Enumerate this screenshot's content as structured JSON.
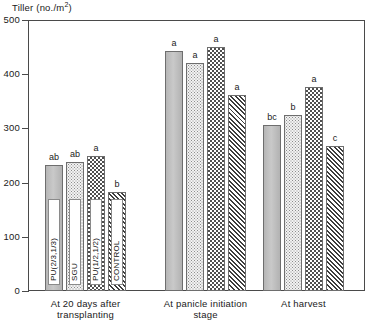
{
  "chart_data": {
    "type": "bar",
    "title": "",
    "ylabel": "Tiller (no./m²)",
    "xlabel": "",
    "ylim": [
      0,
      500
    ],
    "yticks": [
      0,
      100,
      200,
      300,
      400,
      500
    ],
    "ytick_labels": [
      "0",
      "100",
      "200",
      "300",
      "400",
      "500"
    ],
    "grid": false,
    "legend_position": "in-bar-vertical-labels",
    "categories": [
      "At 20 days after transplanting",
      "At panicle initiation stage",
      "At harvest"
    ],
    "series": [
      {
        "name": "PU(2/3,1/3)",
        "pattern": "solid-gray",
        "values": [
          232,
          443,
          307
        ],
        "letters": [
          "ab",
          "a",
          "bc"
        ]
      },
      {
        "name": "SGU",
        "pattern": "light-dots",
        "values": [
          238,
          421,
          325
        ],
        "letters": [
          "ab",
          "a",
          "b"
        ]
      },
      {
        "name": "PU(1/2,1/2)",
        "pattern": "checkerboard",
        "values": [
          249,
          450,
          376
        ],
        "letters": [
          "a",
          "a",
          "a"
        ]
      },
      {
        "name": "CONTROL",
        "pattern": "diagonal-hatch",
        "values": [
          183,
          361,
          267
        ],
        "letters": [
          "b",
          "a",
          "c"
        ]
      }
    ]
  },
  "axis": {
    "y_title_main": "Tiller (no./m",
    "y_title_sup": "2",
    "y_title_close": ")"
  },
  "groups": [
    {
      "line1": "At 20 days after",
      "line2": "transplanting"
    },
    {
      "line1": "At panicle initiation",
      "line2": "stage"
    },
    {
      "line1": "At harvest",
      "line2": ""
    }
  ],
  "colors": {
    "axis": "#4a4a4a",
    "text": "#1a1a1a",
    "bar_solid": "#bdbdbd",
    "bar_outline": "#6e6e6e"
  }
}
